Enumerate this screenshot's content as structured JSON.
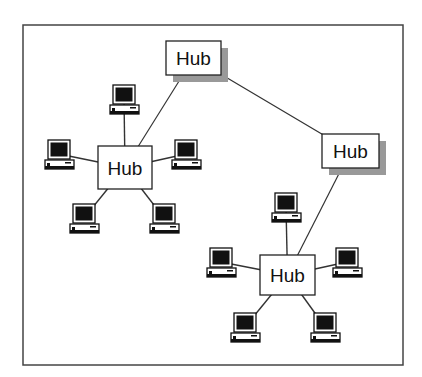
{
  "diagram": {
    "title": "",
    "hubs": [
      {
        "id": "top",
        "label": "Hub",
        "x": 166,
        "y": 41,
        "w": 55,
        "h": 34,
        "shadow": true
      },
      {
        "id": "right",
        "label": "Hub",
        "x": 322,
        "y": 134,
        "w": 57,
        "h": 34,
        "shadow": true
      },
      {
        "id": "left",
        "label": "Hub",
        "x": 98,
        "y": 146,
        "w": 54,
        "h": 43,
        "shadow": false
      },
      {
        "id": "bottom",
        "label": "Hub",
        "x": 260,
        "y": 255,
        "w": 55,
        "h": 40,
        "shadow": false
      }
    ],
    "links": [
      {
        "from": "top",
        "to": "left"
      },
      {
        "from": "top",
        "to": "right"
      },
      {
        "from": "right",
        "to": "bottom"
      }
    ],
    "computers": [
      {
        "hub": "left",
        "x": 110,
        "y": 85
      },
      {
        "hub": "left",
        "x": 45,
        "y": 140
      },
      {
        "hub": "left",
        "x": 172,
        "y": 140
      },
      {
        "hub": "left",
        "x": 70,
        "y": 204
      },
      {
        "hub": "left",
        "x": 150,
        "y": 204
      },
      {
        "hub": "bottom",
        "x": 272,
        "y": 193
      },
      {
        "hub": "bottom",
        "x": 207,
        "y": 248
      },
      {
        "hub": "bottom",
        "x": 333,
        "y": 248
      },
      {
        "hub": "bottom",
        "x": 231,
        "y": 313
      },
      {
        "hub": "bottom",
        "x": 311,
        "y": 313
      }
    ],
    "colors": {
      "line": "#333333",
      "shadow": "#999999",
      "frame": "#444444"
    }
  }
}
